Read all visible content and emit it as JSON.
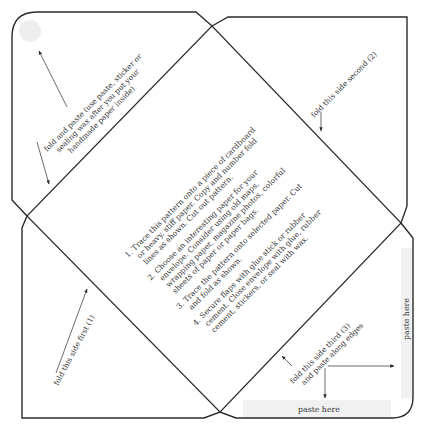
{
  "template": {
    "title": "Envelope template",
    "colors": {
      "line": "#2b2b2b",
      "text": "#333333",
      "paste_area": "#f1f1f1",
      "seal_circle": "#eeeeee"
    },
    "flaps": {
      "top_left": {
        "label_lines": [
          "fold and paste (use paste, sticker or",
          "sealing wax after you put your",
          "handmade paper inside)"
        ]
      },
      "top_right": {
        "label": "fold this side second (2)"
      },
      "bottom_left": {
        "label": "fold this side first (1)"
      },
      "bottom_right": {
        "label_lines": [
          "fold this side third (3)",
          "and paste along edges"
        ],
        "paste_bottom": "paste here",
        "paste_right": "paste here"
      }
    },
    "instructions": [
      "1. Trace this pattern onto a piece of cardboard",
      "or heavy, stiff paper. Copy and number fold",
      "lines as shown. Cut out pattern.",
      "2. Choose an interesting paper for your",
      "envelope. Consider using old maps,",
      "wrapping paper, magazine photos, colorful",
      "sheets of paper or paper bags.",
      "3. Trace the pattern onto selected paper. Cut",
      "and fold as shown.",
      "4. Secure flaps with glue stick or rubber",
      "cement. Close envelope with glue, rubber",
      "cement, stickers, or seal with wax."
    ]
  }
}
